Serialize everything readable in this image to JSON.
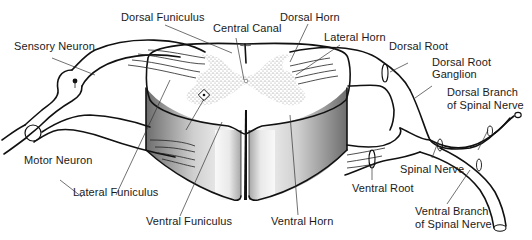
{
  "diagram": {
    "colors": {
      "line": "#111111",
      "stipple": "#9a9a9a",
      "background": "#ffffff"
    },
    "labels": {
      "dorsal_funiculus": "Dorsal Funiculus",
      "central_canal": "Central Canal",
      "dorsal_horn": "Dorsal Horn",
      "lateral_horn": "Lateral Horn",
      "sensory_neuron": "Sensory Neuron",
      "dorsal_root": "Dorsal Root",
      "dorsal_root_ganglion_1": "Dorsal Root",
      "dorsal_root_ganglion_2": "Ganglion",
      "dorsal_branch_1": "Dorsal Branch",
      "dorsal_branch_2": "of Spinal Nerve",
      "motor_neuron": "Motor Neuron",
      "spinal_nerve": "Spinal Nerve",
      "lateral_funiculus": "Lateral Funiculus",
      "ventral_root": "Ventral Root",
      "ventral_funiculus": "Ventral Funiculus",
      "ventral_horn": "Ventral Horn",
      "ventral_branch_1": "Ventral Branch",
      "ventral_branch_2": "of Spinal Nerve"
    }
  }
}
